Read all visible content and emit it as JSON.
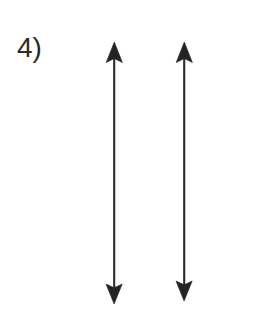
{
  "page": {
    "background_color": "#ffffff",
    "width": 280,
    "height": 313,
    "media": "scanned-worksheet"
  },
  "label": {
    "text": "4)",
    "color": "#2b2b2b"
  },
  "diagram": {
    "ink_color": "#232323",
    "shaft_color": "#2a2a2a",
    "arrow_count": 2,
    "arrows": [
      {
        "name": "left-arrow",
        "orientation": "vertical",
        "double_headed": true,
        "x": 114,
        "top_y": 42,
        "bottom_y": 304,
        "head_width": 17,
        "head_length": 18,
        "length_px": 262
      },
      {
        "name": "right-arrow",
        "orientation": "vertical",
        "double_headed": true,
        "x": 184,
        "top_y": 42,
        "bottom_y": 301,
        "head_width": 17,
        "head_length": 18,
        "length_px": 259
      }
    ]
  }
}
